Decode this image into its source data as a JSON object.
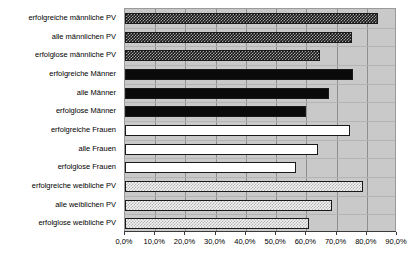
{
  "chart_data": {
    "type": "bar",
    "orientation": "horizontal",
    "title": "",
    "subtitle": "",
    "xlabel": "",
    "ylabel": "",
    "grid": true,
    "legend": false,
    "xlim": [
      0,
      90
    ],
    "xticks": [
      0,
      10,
      20,
      30,
      40,
      50,
      60,
      70,
      80,
      90
    ],
    "xtick_labels": [
      "0,0%",
      "10,0%",
      "20,0%",
      "30,0%",
      "40,0%",
      "50,0%",
      "60,0%",
      "70,0%",
      "80,0%",
      "90,0%"
    ],
    "value_unit": "%",
    "decimal_separator": ",",
    "categories": [
      "erfolgreiche männliche PV",
      "alle männlichen PV",
      "erfolglose männliche PV",
      "erfolgreiche Männer",
      "alle Männer",
      "erfolglose Männer",
      "erfolgreiche Frauen",
      "alle Frauen",
      "erfolglose Frauen",
      "erfolgreiche weibliche PV",
      "alle weiblichen PV",
      "erfolglose weibliche PV"
    ],
    "values": [
      83.6,
      75.0,
      64.6,
      75.6,
      67.5,
      59.8,
      74.6,
      64.0,
      56.6,
      78.8,
      68.5,
      61.0
    ],
    "bars": [
      {
        "category": "erfolgreiche männliche PV",
        "value": 83.6,
        "fill": "dark-checker"
      },
      {
        "category": "alle männlichen PV",
        "value": 75.0,
        "fill": "dark-checker"
      },
      {
        "category": "erfolglose männliche PV",
        "value": 64.6,
        "fill": "dark-checker"
      },
      {
        "category": "erfolgreiche Männer",
        "value": 75.6,
        "fill": "solid-black"
      },
      {
        "category": "alle Männer",
        "value": 67.5,
        "fill": "solid-black"
      },
      {
        "category": "erfolglose Männer",
        "value": 59.8,
        "fill": "solid-black"
      },
      {
        "category": "erfolgreiche Frauen",
        "value": 74.6,
        "fill": "white"
      },
      {
        "category": "alle Frauen",
        "value": 64.0,
        "fill": "white"
      },
      {
        "category": "erfolglose Frauen",
        "value": 56.6,
        "fill": "white"
      },
      {
        "category": "erfolgreiche weibliche PV",
        "value": 78.8,
        "fill": "light-checker"
      },
      {
        "category": "alle weiblichen PV",
        "value": 68.5,
        "fill": "light-checker"
      },
      {
        "category": "erfolglose weibliche PV",
        "value": 61.0,
        "fill": "light-checker"
      }
    ],
    "colors": {
      "plot_background": "#c9c9c9",
      "gridline": "#8f8f8f",
      "bar_outline": "#1a1a1a",
      "dark_checker": "#151515",
      "solid_black": "#0a0a0a",
      "white_bar": "#ffffff",
      "light_checker": "#f2f2f2",
      "axis": "#3a3a3a",
      "text": "#000000"
    }
  }
}
